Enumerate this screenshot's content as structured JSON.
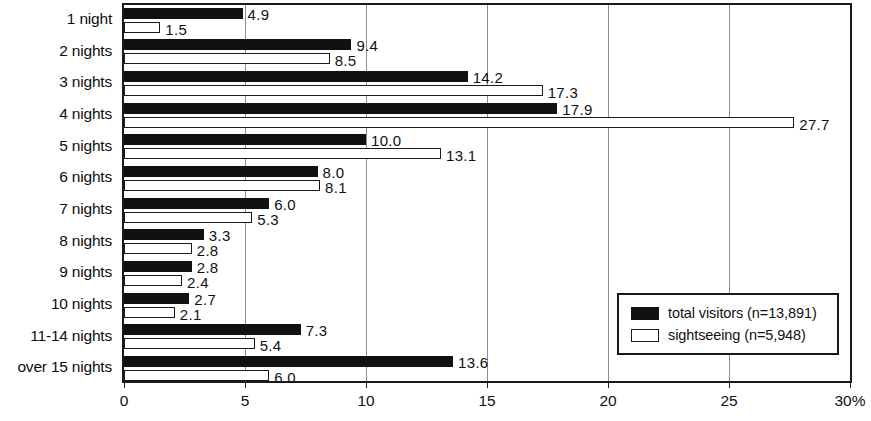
{
  "chart_data": {
    "type": "bar",
    "orientation": "horizontal",
    "title": "",
    "xlabel": "",
    "ylabel": "",
    "xlim": [
      0,
      30
    ],
    "xticks": [
      0,
      5,
      10,
      15,
      20,
      25,
      30
    ],
    "xtick_labels": [
      "0",
      "5",
      "10",
      "15",
      "20",
      "25",
      "30%"
    ],
    "grid": "vertical",
    "legend_position": "bottom-right",
    "categories": [
      "1 night",
      "2 nights",
      "3 nights",
      "4 nights",
      "5 nights",
      "6 nights",
      "7 nights",
      "8 nights",
      "9 nights",
      "10 nights",
      "11-14 nights",
      "over 15 nights"
    ],
    "series": [
      {
        "name": "total visitors (n=13,891)",
        "color": "#111111",
        "values": [
          4.9,
          9.4,
          14.2,
          17.9,
          10.0,
          8.0,
          6.0,
          3.3,
          2.8,
          2.7,
          7.3,
          13.6
        ],
        "value_labels": [
          "4.9",
          "9.4",
          "14.2",
          "17.9",
          "10.0",
          "8.0",
          "6.0",
          "3.3",
          "2.8",
          "2.7",
          "7.3",
          "13.6"
        ]
      },
      {
        "name": "sightseeing (n=5,948)",
        "color": "#ffffff",
        "values": [
          1.5,
          8.5,
          17.3,
          27.7,
          13.1,
          8.1,
          5.3,
          2.8,
          2.4,
          2.1,
          5.4,
          6.0
        ],
        "value_labels": [
          "1.5",
          "8.5",
          "17.3",
          "27.7",
          "13.1",
          "8.1",
          "5.3",
          "2.8",
          "2.4",
          "2.1",
          "5.4",
          "6.0"
        ]
      }
    ]
  },
  "legend": {
    "items": [
      {
        "label": "total visitors (n=13,891)",
        "swatch": "filled-black"
      },
      {
        "label": "sightseeing (n=5,948)",
        "swatch": "outlined-white"
      }
    ]
  }
}
